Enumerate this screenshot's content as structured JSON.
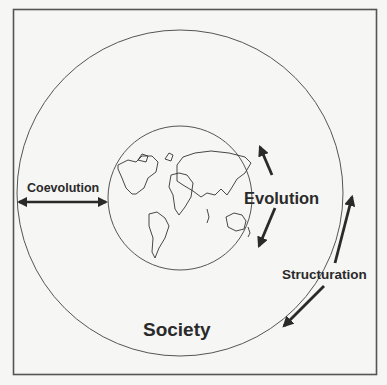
{
  "diagram": {
    "labels": {
      "outer": "Society",
      "inner": "Nature",
      "coevolution": "Coevolution",
      "evolution": "Evolution",
      "structuration": "Structuration"
    },
    "colors": {
      "background": "#f6f6f4",
      "stroke": "#4a4a4a",
      "text": "#2a2a2a"
    }
  }
}
